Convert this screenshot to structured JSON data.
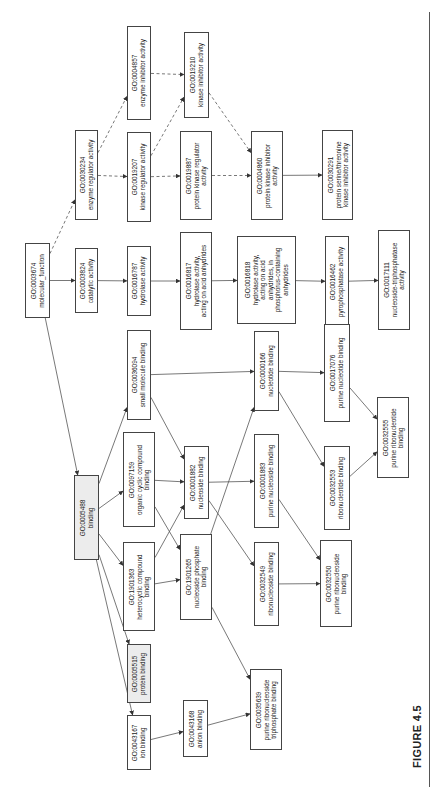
{
  "figure": {
    "label": "FIGURE 4.5"
  },
  "nodes": [
    {
      "id": "GO:0003674",
      "label": "molecular_function",
      "lines": [
        "GO:0003674",
        "molecular_function"
      ],
      "box": [
        25,
        243,
        25,
        75
      ],
      "shaded": false
    },
    {
      "id": "GO:0003824",
      "label": "catalytic activity",
      "lines": [
        "GO:0003824",
        "catalytic activity"
      ],
      "box": [
        75,
        248,
        23,
        65
      ],
      "shaded": false
    },
    {
      "id": "GO:0016787",
      "label": "hydrolase activity",
      "lines": [
        "GO:0016787",
        "hydrolase activity"
      ],
      "box": [
        127,
        246,
        24,
        70
      ],
      "shaded": false
    },
    {
      "id": "GO:0016817",
      "label": "hydrolase activity, acting on acid anhydrides",
      "lines": [
        "GO:0016817",
        "hydrolase activity,",
        "acting on acid anhydrides"
      ],
      "box": [
        180,
        232,
        32,
        98
      ],
      "shaded": false
    },
    {
      "id": "GO:0016818",
      "label": "hydrolase activity, acting on acid anhydrides, in phosphorus-containing anhydrides",
      "lines": [
        "GO:0016818",
        "hydrolase activity,",
        "acting on acid",
        "anhydrides, in",
        "phosphorus-containing",
        "anhydrides"
      ],
      "box": [
        237,
        236,
        59,
        88
      ],
      "shaded": false
    },
    {
      "id": "GO:0016462",
      "label": "pyrophosphatase activity",
      "lines": [
        "GO:0016462",
        "pyrophosphatase activity"
      ],
      "box": [
        325,
        236,
        24,
        91
      ],
      "shaded": false
    },
    {
      "id": "GO:0017111",
      "label": "nucleoside-triphosphatase activity",
      "lines": [
        "GO:0017111",
        "nucleoside-triphosphatase",
        "activity"
      ],
      "box": [
        378,
        230,
        32,
        100
      ],
      "shaded": false
    },
    {
      "id": "GO:0030234",
      "label": "enzyme regulator activity",
      "lines": [
        "GO:0030234",
        "enzyme regulator activity"
      ],
      "box": [
        75,
        130,
        23,
        90
      ],
      "shaded": false
    },
    {
      "id": "GO:0019207",
      "label": "kinase regulator activity",
      "lines": [
        "GO:0019207",
        "kinase regulator activity"
      ],
      "box": [
        127,
        132,
        24,
        90
      ],
      "shaded": false
    },
    {
      "id": "GO:0019887",
      "label": "protein kinase regulator activity",
      "lines": [
        "GO:0019887",
        "protein kinase regulator",
        "activity"
      ],
      "box": [
        180,
        131,
        32,
        89
      ],
      "shaded": false
    },
    {
      "id": "GO:0004857",
      "label": "enzyme inhibitor activity",
      "lines": [
        "GO:0004857",
        "enzyme inhibitor activity"
      ],
      "box": [
        127,
        26,
        24,
        94
      ],
      "shaded": false
    },
    {
      "id": "GO:0019210",
      "label": "kinase inhibitor activity",
      "lines": [
        "GO:0019210",
        "kinase inhibitor activity"
      ],
      "box": [
        184,
        32,
        25,
        86
      ],
      "shaded": false
    },
    {
      "id": "GO:0004860",
      "label": "protein kinase inhibitor activity",
      "lines": [
        "GO:0004860",
        "protein kinase inhibitor",
        "activity"
      ],
      "box": [
        251,
        131,
        32,
        89
      ],
      "shaded": false
    },
    {
      "id": "GO:0030291",
      "label": "protein serine/threonine kinase inhibitor activity",
      "lines": [
        "GO:0030291",
        "protein serine/threonine",
        "kinase inhibitor activity"
      ],
      "box": [
        322,
        130,
        31,
        90
      ],
      "shaded": false
    },
    {
      "id": "GO:0005488",
      "label": "binding",
      "lines": [
        "GO:0005488",
        "binding"
      ],
      "box": [
        74,
        475,
        25,
        85
      ],
      "shaded": true
    },
    {
      "id": "GO:0036094",
      "label": "small molecule binding",
      "lines": [
        "GO:0036094",
        "small molecule binding"
      ],
      "box": [
        127,
        330,
        24,
        90
      ],
      "shaded": false
    },
    {
      "id": "GO:0097159",
      "label": "organic cyclic compound binding",
      "lines": [
        "GO:0097159",
        "organic cyclic compound",
        "binding"
      ],
      "box": [
        123,
        432,
        32,
        95
      ],
      "shaded": false
    },
    {
      "id": "GO:1901363",
      "label": "heterocyclic compound binding",
      "lines": [
        "GO:1901363",
        "heterocyclic compound",
        "binding"
      ],
      "box": [
        123,
        542,
        32,
        89
      ],
      "shaded": false
    },
    {
      "id": "GO:0001882",
      "label": "nucleoside binding",
      "lines": [
        "GO:0001882",
        "nucleoside binding"
      ],
      "box": [
        184,
        446,
        25,
        73
      ],
      "shaded": false
    },
    {
      "id": "GO:1901265",
      "label": "nucleoside phosphate binding",
      "lines": [
        "GO:1901265",
        "nucleoside phosphate",
        "binding"
      ],
      "box": [
        180,
        534,
        32,
        86
      ],
      "shaded": false
    },
    {
      "id": "GO:0000166",
      "label": "nucleotide binding",
      "lines": [
        "GO:0000166",
        "nucleotide binding"
      ],
      "box": [
        254,
        331,
        25,
        80
      ],
      "shaded": false
    },
    {
      "id": "GO:0001883",
      "label": "purine nucleoside binding",
      "lines": [
        "GO:0001883",
        "purine nucleoside binding"
      ],
      "box": [
        254,
        434,
        25,
        94
      ],
      "shaded": false
    },
    {
      "id": "GO:0032549",
      "label": "ribonucleoside binding",
      "lines": [
        "GO:0032549",
        "ribonucleoside binding"
      ],
      "box": [
        254,
        542,
        25,
        84
      ],
      "shaded": false
    },
    {
      "id": "GO:0017076",
      "label": "purine nucleotide binding",
      "lines": [
        "GO:0017076",
        "purine nucleotide binding"
      ],
      "box": [
        324,
        324,
        26,
        98
      ],
      "shaded": false
    },
    {
      "id": "GO:0032553",
      "label": "ribonucleotide binding",
      "lines": [
        "GO:0032553",
        "ribonucleotide binding"
      ],
      "box": [
        324,
        446,
        26,
        84
      ],
      "shaded": false
    },
    {
      "id": "GO:0032550",
      "label": "purine ribonucleoside binding",
      "lines": [
        "GO:0032550",
        "purine ribonucleoside",
        "binding"
      ],
      "box": [
        320,
        540,
        32,
        87
      ],
      "shaded": false
    },
    {
      "id": "GO:0032555",
      "label": "purine ribonucleotide binding",
      "lines": [
        "GO:0032555",
        "purine ribonucleotide",
        "binding"
      ],
      "box": [
        377,
        397,
        32,
        81
      ],
      "shaded": false
    },
    {
      "id": "GO:0005515",
      "label": "protein binding",
      "lines": [
        "GO:0005515",
        "protein binding"
      ],
      "box": [
        127,
        644,
        24,
        59
      ],
      "shaded": true
    },
    {
      "id": "GO:0043167",
      "label": "ion binding",
      "lines": [
        "GO:0043167",
        "ion binding"
      ],
      "box": [
        127,
        715,
        24,
        55
      ],
      "shaded": false
    },
    {
      "id": "GO:0043168",
      "label": "anion binding",
      "lines": [
        "GO:0043168",
        "anion binding"
      ],
      "box": [
        183,
        700,
        25,
        57
      ],
      "shaded": false
    },
    {
      "id": "GO:0035639",
      "label": "purine ribonucleoside triphosphate binding",
      "lines": [
        "GO:0035639",
        "purine ribonucleoside",
        "triphosphate binding"
      ],
      "box": [
        250,
        669,
        32,
        81
      ],
      "shaded": false
    }
  ],
  "edges": [
    {
      "from": "GO:0003674",
      "to": "GO:0003824",
      "style": "solid"
    },
    {
      "from": "GO:0003674",
      "to": "GO:0030234",
      "style": "dashed"
    },
    {
      "from": "GO:0003674",
      "to": "GO:0005488",
      "style": "solid"
    },
    {
      "from": "GO:0003824",
      "to": "GO:0016787",
      "style": "solid"
    },
    {
      "from": "GO:0016787",
      "to": "GO:0016817",
      "style": "solid"
    },
    {
      "from": "GO:0016817",
      "to": "GO:0016818",
      "style": "solid"
    },
    {
      "from": "GO:0016818",
      "to": "GO:0016462",
      "style": "solid"
    },
    {
      "from": "GO:0016462",
      "to": "GO:0017111",
      "style": "solid"
    },
    {
      "from": "GO:0030234",
      "to": "GO:0019207",
      "style": "dashed"
    },
    {
      "from": "GO:0030234",
      "to": "GO:0004857",
      "style": "dashed"
    },
    {
      "from": "GO:0019207",
      "to": "GO:0019887",
      "style": "dashed"
    },
    {
      "from": "GO:0019207",
      "to": "GO:0019210",
      "style": "dashed"
    },
    {
      "from": "GO:0004857",
      "to": "GO:0019210",
      "style": "dashed"
    },
    {
      "from": "GO:0019887",
      "to": "GO:0004860",
      "style": "dashed"
    },
    {
      "from": "GO:0019210",
      "to": "GO:0004860",
      "style": "dashed"
    },
    {
      "from": "GO:0004860",
      "to": "GO:0030291",
      "style": "solid"
    },
    {
      "from": "GO:0005488",
      "to": "GO:0036094",
      "style": "solid"
    },
    {
      "from": "GO:0005488",
      "to": "GO:0097159",
      "style": "solid"
    },
    {
      "from": "GO:0005488",
      "to": "GO:1901363",
      "style": "solid"
    },
    {
      "from": "GO:0005488",
      "to": "GO:0005515",
      "style": "solid"
    },
    {
      "from": "GO:0005488",
      "to": "GO:0043167",
      "style": "solid"
    },
    {
      "from": "GO:0036094",
      "to": "GO:0000166",
      "style": "solid"
    },
    {
      "from": "GO:0036094",
      "to": "GO:0001882",
      "style": "solid"
    },
    {
      "from": "GO:0097159",
      "to": "GO:0001882",
      "style": "solid"
    },
    {
      "from": "GO:0097159",
      "to": "GO:1901265",
      "style": "solid"
    },
    {
      "from": "GO:1901363",
      "to": "GO:0001882",
      "style": "solid"
    },
    {
      "from": "GO:1901363",
      "to": "GO:1901265",
      "style": "solid"
    },
    {
      "from": "GO:0001882",
      "to": "GO:0001883",
      "style": "solid"
    },
    {
      "from": "GO:0001882",
      "to": "GO:0032549",
      "style": "solid"
    },
    {
      "from": "GO:1901265",
      "to": "GO:0000166",
      "style": "solid"
    },
    {
      "from": "GO:1901265",
      "to": "GO:0035639",
      "style": "solid"
    },
    {
      "from": "GO:0000166",
      "to": "GO:0017076",
      "style": "solid"
    },
    {
      "from": "GO:0000166",
      "to": "GO:0032553",
      "style": "solid"
    },
    {
      "from": "GO:0001883",
      "to": "GO:0032550",
      "style": "solid"
    },
    {
      "from": "GO:0032549",
      "to": "GO:0032550",
      "style": "solid"
    },
    {
      "from": "GO:0017076",
      "to": "GO:0032555",
      "style": "solid"
    },
    {
      "from": "GO:0032553",
      "to": "GO:0032555",
      "style": "solid"
    },
    {
      "from": "GO:0043167",
      "to": "GO:0043168",
      "style": "solid"
    },
    {
      "from": "GO:0043168",
      "to": "GO:0035639",
      "style": "solid"
    }
  ],
  "colors": {
    "edge": "#555555",
    "border": "#444444",
    "shaded_fill": "#ececec"
  }
}
